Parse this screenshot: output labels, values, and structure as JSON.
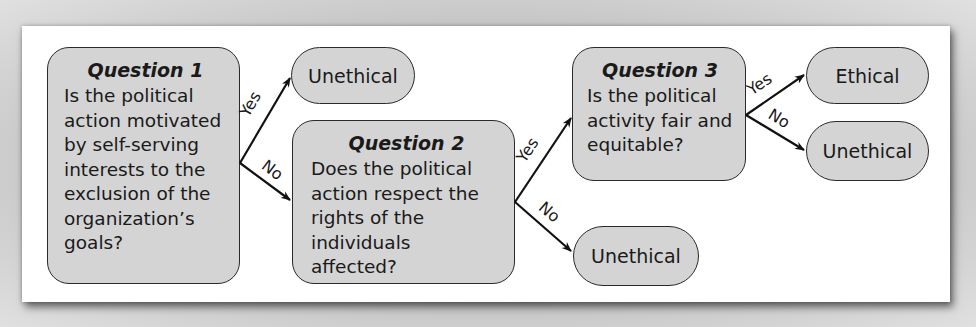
{
  "diagram": {
    "type": "decision-flowchart",
    "questions": [
      {
        "title": "Question 1",
        "text": "Is the political\naction motivated\nby self-serving\ninterests to the\nexclusion of the\norganization’s\ngoals?"
      },
      {
        "title": "Question 2",
        "text": "Does the political\naction respect the\nrights of the\nindividuals affected?"
      },
      {
        "title": "Question 3",
        "text": "Is the political\nactivity fair and\nequitable?"
      }
    ],
    "outcomes": {
      "q1_yes": "Unethical",
      "q2_no": "Unethical",
      "q3_yes": "Ethical",
      "q3_no": "Unethical"
    },
    "edge_labels": {
      "yes": "Yes",
      "no": "No"
    },
    "edges": [
      {
        "from": "Question 1",
        "label": "Yes",
        "to": "Unethical"
      },
      {
        "from": "Question 1",
        "label": "No",
        "to": "Question 2"
      },
      {
        "from": "Question 2",
        "label": "Yes",
        "to": "Question 3"
      },
      {
        "from": "Question 2",
        "label": "No",
        "to": "Unethical"
      },
      {
        "from": "Question 3",
        "label": "Yes",
        "to": "Ethical"
      },
      {
        "from": "Question 3",
        "label": "No",
        "to": "Unethical"
      }
    ],
    "colors": {
      "box_fill": "#d4d4d4",
      "border": "#2a2a2a",
      "panel": "#ffffff"
    }
  }
}
